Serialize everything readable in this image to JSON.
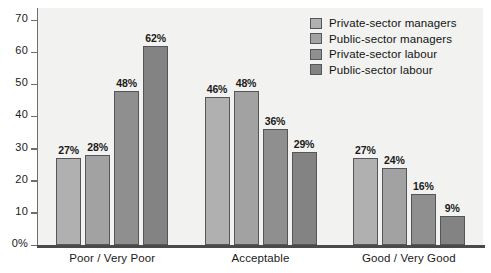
{
  "chart_data": {
    "type": "bar",
    "title": "",
    "xlabel": "",
    "ylabel": "",
    "ylim": [
      0,
      70
    ],
    "grid": false,
    "legend_position": "top-right",
    "categories": [
      "Poor / Very Poor",
      "Acceptable",
      "Good / Very Good"
    ],
    "y_ticks": [
      "0%",
      "10",
      "20",
      "30",
      "40",
      "50",
      "60",
      "70"
    ],
    "y_tick_values": [
      0,
      10,
      20,
      30,
      40,
      50,
      60,
      70
    ],
    "series": [
      {
        "name": "Private-sector managers",
        "color": "#b0b0b0",
        "values": [
          27,
          46,
          27
        ],
        "labels": [
          "27%",
          "46%",
          "27%"
        ]
      },
      {
        "name": "Public-sector managers",
        "color": "#a2a2a2",
        "values": [
          28,
          48,
          24
        ],
        "labels": [
          "28%",
          "48%",
          "24%"
        ]
      },
      {
        "name": "Private-sector labour",
        "color": "#8f8f8f",
        "values": [
          48,
          36,
          16
        ],
        "labels": [
          "48%",
          "36%",
          "16%"
        ]
      },
      {
        "name": "Public-sector labour",
        "color": "#838383",
        "values": [
          62,
          29,
          9
        ],
        "labels": [
          "62%",
          "29%",
          "9%"
        ]
      }
    ]
  },
  "legend": {
    "items": [
      {
        "label": "Private-sector managers"
      },
      {
        "label": "Public-sector managers"
      },
      {
        "label": "Private-sector labour"
      },
      {
        "label": "Public-sector labour"
      }
    ]
  },
  "colors": {
    "plot_background": "#f2f2f0",
    "axis": "#6e6e6e",
    "baseline": "#4a4a4a",
    "bar_border": "#55555a",
    "text": "#1a1a1a"
  }
}
